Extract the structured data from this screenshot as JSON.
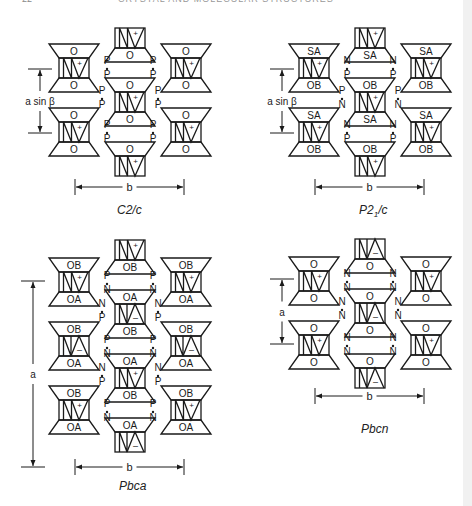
{
  "page": {
    "header_number": "22",
    "header_title": "CRYSTAL AND MOLECULAR STRUCTURES"
  },
  "panels": [
    {
      "id": "c2c",
      "caption": "C2/c",
      "caption_sub": "",
      "vertical_dimension_label": "a sin β",
      "horizontal_dimension_label": "b",
      "origin": [
        0,
        0
      ],
      "side_columns_units": [
        {
          "top": "O",
          "bottom": "O",
          "sign": "+",
          "pattern": "NV"
        },
        {
          "top": "O",
          "bottom": "O",
          "sign": "+",
          "pattern": "NV"
        }
      ],
      "middle_column": {
        "top_partial": {
          "label": "O",
          "sign": "+",
          "pattern": "NV"
        },
        "full": {
          "top": "O",
          "bottom": "O",
          "sign": "+",
          "pattern": "NV"
        },
        "bottom_partial": {
          "label": "O",
          "sign": "+",
          "pattern": "NV"
        }
      },
      "contacts_left": [
        [
          "P",
          "P"
        ],
        [
          "P",
          "P"
        ]
      ],
      "contacts_mid": [
        "P",
        "P"
      ],
      "contacts_right": [
        [
          "P",
          "P"
        ],
        [
          "P",
          "P"
        ]
      ]
    },
    {
      "id": "p21c",
      "caption": "P2",
      "caption_sub": "1",
      "caption_tail": "/c",
      "vertical_dimension_label": "a sin β",
      "horizontal_dimension_label": "b",
      "origin": [
        240,
        0
      ],
      "side_columns_units": [
        {
          "top": "SA",
          "bottom": "OB",
          "sign": "+",
          "pattern": "NV"
        },
        {
          "top": "SA",
          "bottom": "OB",
          "sign": "+",
          "pattern": "NV"
        }
      ],
      "middle_column": {
        "top_partial": {
          "label": "SA",
          "sign": "+",
          "pattern": "NV"
        },
        "full": {
          "top": "OB",
          "bottom": "SA",
          "sign": "+",
          "pattern": "NV"
        },
        "bottom_partial": {
          "label": "OB",
          "sign": "+",
          "pattern": "NV"
        }
      },
      "contacts_left": [
        [
          "N",
          "P"
        ],
        [
          "N",
          "P"
        ]
      ],
      "contacts_mid": [
        "P",
        "N"
      ],
      "contacts_right": [
        [
          "N",
          "P"
        ],
        [
          "N",
          "P"
        ]
      ]
    },
    {
      "id": "pbca",
      "caption": "Pbca",
      "caption_sub": "",
      "vertical_dimension_label": "a",
      "horizontal_dimension_label": "b",
      "origin": [
        0,
        235
      ],
      "units": [
        {
          "col": "left",
          "top": "OB",
          "bottom": "OA",
          "sign": "+",
          "pattern": "NV"
        },
        {
          "col": "left",
          "top": "OB",
          "bottom": "OA",
          "sign": "–",
          "pattern": "VΛ"
        },
        {
          "col": "left",
          "top": "OB",
          "bottom": "OA",
          "sign": "+",
          "pattern": "NV"
        },
        {
          "col": "right",
          "top": "OB",
          "bottom": "OA",
          "sign": "+",
          "pattern": "NV"
        },
        {
          "col": "right",
          "top": "OB",
          "bottom": "OA",
          "sign": "–",
          "pattern": "VΛ"
        },
        {
          "col": "right",
          "top": "OB",
          "bottom": "OA",
          "sign": "+",
          "pattern": "NV"
        }
      ],
      "middle_column": [
        {
          "type": "top_partial",
          "label": "OB",
          "sign": "+",
          "pattern": "NV"
        },
        {
          "type": "full",
          "top": "OA",
          "bottom": "OB",
          "sign": "–",
          "pattern": "VΛ"
        },
        {
          "type": "full",
          "top": "OA",
          "bottom": "OB",
          "sign": "+",
          "pattern": "NV"
        },
        {
          "type": "bottom_partial",
          "label": "OA",
          "sign": "–",
          "pattern": "VΛ"
        }
      ],
      "contacts_side": [
        "P",
        "N"
      ],
      "contacts_mid": [
        "N",
        "P"
      ]
    },
    {
      "id": "pbcn",
      "caption": "Pbcn",
      "caption_sub": "",
      "vertical_dimension_label": "a",
      "horizontal_dimension_label": "b",
      "origin": [
        240,
        235
      ],
      "side_columns_units": [
        {
          "top": "O",
          "bottom": "O",
          "sign": "+",
          "pattern": "NV"
        },
        {
          "top": "O",
          "bottom": "O",
          "sign": "+",
          "pattern": "NV"
        }
      ],
      "middle_column": {
        "top_partial": {
          "label": "O",
          "sign": "–",
          "pattern": "VΛ"
        },
        "full": {
          "top": "O",
          "bottom": "O",
          "sign": "–",
          "pattern": "VΛ"
        },
        "bottom_partial": {
          "label": "O",
          "sign": "–",
          "pattern": "VΛ"
        }
      },
      "contacts_left": [
        [
          "N",
          "N"
        ],
        [
          "N",
          "N"
        ]
      ],
      "contacts_mid": [
        "N",
        "N"
      ],
      "contacts_right": [
        [
          "N",
          "N"
        ],
        [
          "N",
          "N"
        ]
      ]
    }
  ],
  "colors": {
    "ink": "#1a1a1a",
    "background": "#ffffff",
    "edge_stripe": "#f1f1f1"
  }
}
